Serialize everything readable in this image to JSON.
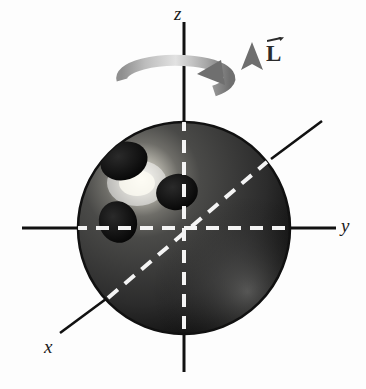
{
  "figure": {
    "background_color": "#fdfdfd"
  },
  "axes": {
    "z": {
      "label": "z",
      "orientation": "vertical",
      "color": "#111111",
      "top_point": [
        184,
        22
      ],
      "bottom_point": [
        184,
        372
      ]
    },
    "y": {
      "label": "y",
      "orientation": "horizontal",
      "color": "#111111",
      "left_point": [
        22,
        228
      ],
      "right_point": [
        336,
        228
      ]
    },
    "x": {
      "label": "x",
      "orientation": "diagonal-toward-viewer",
      "color": "#111111",
      "near_point": [
        60,
        333
      ],
      "far_point": [
        322,
        121
      ]
    },
    "dashed_color": "#f2f2f2",
    "origin": [
      184,
      228
    ]
  },
  "ball": {
    "name": "bowling-ball",
    "center": [
      184,
      228
    ],
    "radius": 106,
    "base_color": "#3a3a3a",
    "shadow_color": "#0a0a0a",
    "highlight_color": "#f0efe8",
    "highlight_center": [
      138,
      182
    ],
    "outline_color": "#111111",
    "finger_holes": [
      {
        "name": "thumb-hole",
        "cx": 124,
        "cy": 161,
        "rx": 24,
        "ry": 19,
        "rotation": -18
      },
      {
        "name": "middle-finger-hole",
        "cx": 177,
        "cy": 192,
        "rx": 21,
        "ry": 18,
        "rotation": -12
      },
      {
        "name": "ring-finger-hole",
        "cx": 118,
        "cy": 222,
        "rx": 19,
        "ry": 21,
        "rotation": -18
      }
    ]
  },
  "spin_arrow": {
    "name": "rotation-arrow",
    "description": "counterclockwise spin about z-axis viewed from above",
    "center": [
      176,
      80
    ],
    "rx": 54,
    "ry": 17,
    "color_light": "#d8d8d8",
    "color_dark": "#7d7d7d"
  },
  "angular_momentum_vector": {
    "label": "L",
    "symbol_accent": "vector-arrow-overbar",
    "direction": "up",
    "color": "#6e6e6e",
    "tail": [
      252,
      116
    ],
    "tip": [
      252,
      44
    ],
    "label_color": "#2b2b2b"
  }
}
